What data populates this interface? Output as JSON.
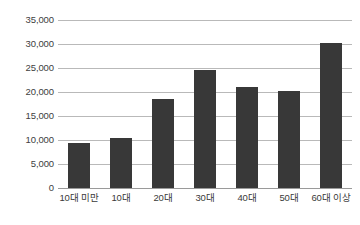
{
  "chart_data": {
    "type": "bar",
    "title": "",
    "subtitle": "",
    "xlabel": "",
    "ylabel": "",
    "categories": [
      "10대 미만",
      "10대",
      "20대",
      "30대",
      "40대",
      "50대",
      "60대 이상"
    ],
    "values": [
      9300,
      10500,
      18500,
      24500,
      21000,
      20300,
      30200
    ],
    "series": [
      {
        "name": "",
        "values": [
          9300,
          10500,
          18500,
          24500,
          21000,
          20300,
          30200
        ]
      }
    ],
    "ylim": [
      0,
      35000
    ],
    "ytick_values": [
      0,
      5000,
      10000,
      15000,
      20000,
      25000,
      30000,
      35000
    ],
    "ytick_labels": [
      "0",
      "5,000",
      "10,000",
      "15,000",
      "20,000",
      "25,000",
      "30,000",
      "35,000"
    ],
    "grid": "horizontal",
    "legend": "none",
    "bar_color": "#383838",
    "gridline_color": "#b9b9b9",
    "background_color": "#ffffff",
    "annotations": []
  }
}
